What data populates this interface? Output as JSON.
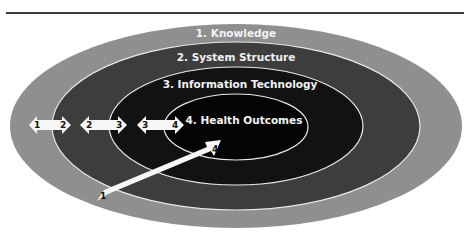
{
  "diagram": {
    "title": "",
    "layers": [
      {
        "label": "1. Knowledge",
        "color": "#8f8f8f"
      },
      {
        "label": "2. System Structure",
        "color": "#3d3d3d"
      },
      {
        "label": "3. Information Technology",
        "color": "#121212"
      },
      {
        "label": "4. Health Outcomes",
        "color": "#050505"
      }
    ],
    "arrows": [
      {
        "from": "1",
        "to": "2",
        "type": "double"
      },
      {
        "from": "2",
        "to": "3",
        "type": "double"
      },
      {
        "from": "3",
        "to": "4",
        "type": "double"
      },
      {
        "from": "1",
        "to": "4",
        "type": "single-diagonal"
      }
    ],
    "colors": {
      "ring_stroke": "#e8e8e8",
      "arrow_fill": "#f7f7f7",
      "label_text": "#f2f2f2"
    }
  }
}
